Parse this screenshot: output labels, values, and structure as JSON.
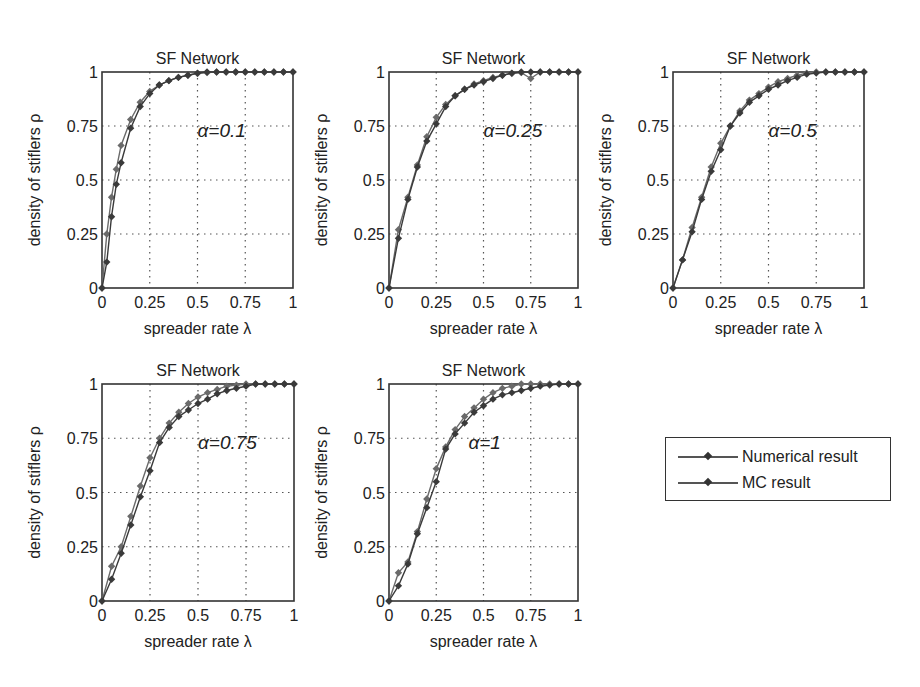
{
  "figure": {
    "panel_title": "SF Network",
    "xlabel": "spreader rate λ",
    "ylabel": "density of stiflers ρ",
    "xticks": [
      "0",
      "0.25",
      "0.5",
      "0.75",
      "1"
    ],
    "yticks": [
      "0",
      "0.25",
      "0.5",
      "0.75",
      "1"
    ]
  },
  "legend": {
    "items": [
      {
        "label": "Numerical result",
        "color": "#555555"
      },
      {
        "label": "MC result",
        "color": "#333333"
      }
    ]
  },
  "chart_data": [
    {
      "type": "line",
      "title": "SF Network",
      "annotation": "α=0.1",
      "xlabel": "spreader rate λ",
      "ylabel": "density of stiflers ρ",
      "xlim": [
        0,
        1
      ],
      "ylim": [
        0,
        1
      ],
      "grid": true,
      "x": [
        0,
        0.025,
        0.05,
        0.075,
        0.1,
        0.15,
        0.2,
        0.25,
        0.3,
        0.35,
        0.4,
        0.45,
        0.5,
        0.55,
        0.6,
        0.65,
        0.7,
        0.75,
        0.8,
        0.85,
        0.9,
        0.95,
        1.0
      ],
      "series": [
        {
          "name": "Numerical result",
          "values": [
            0,
            0.25,
            0.42,
            0.55,
            0.66,
            0.78,
            0.86,
            0.91,
            0.94,
            0.96,
            0.975,
            0.985,
            0.993,
            0.997,
            1,
            1,
            1,
            1,
            1,
            1,
            1,
            1,
            1
          ]
        },
        {
          "name": "MC result",
          "values": [
            0,
            0.12,
            0.33,
            0.48,
            0.58,
            0.74,
            0.84,
            0.9,
            0.94,
            0.96,
            0.975,
            0.985,
            0.995,
            1,
            1,
            1,
            1,
            1,
            1,
            1,
            1,
            1,
            1
          ]
        }
      ]
    },
    {
      "type": "line",
      "title": "SF Network",
      "annotation": "α=0.25",
      "xlabel": "spreader rate λ",
      "ylabel": "density of stiflers ρ",
      "xlim": [
        0,
        1
      ],
      "ylim": [
        0,
        1
      ],
      "grid": true,
      "x": [
        0,
        0.05,
        0.1,
        0.15,
        0.2,
        0.25,
        0.3,
        0.35,
        0.4,
        0.45,
        0.5,
        0.55,
        0.6,
        0.65,
        0.7,
        0.75,
        0.8,
        0.85,
        0.9,
        0.95,
        1.0
      ],
      "series": [
        {
          "name": "Numerical result",
          "values": [
            0,
            0.27,
            0.42,
            0.57,
            0.7,
            0.79,
            0.85,
            0.89,
            0.92,
            0.945,
            0.96,
            0.975,
            0.985,
            0.993,
            0.997,
            0.97,
            1,
            1,
            1,
            1,
            1
          ]
        },
        {
          "name": "MC result",
          "values": [
            0,
            0.23,
            0.41,
            0.56,
            0.68,
            0.76,
            0.84,
            0.89,
            0.92,
            0.94,
            0.955,
            0.97,
            0.985,
            0.995,
            1,
            1,
            1,
            1,
            1,
            1,
            1
          ]
        }
      ]
    },
    {
      "type": "line",
      "title": "SF Network",
      "annotation": "α=0.5",
      "xlabel": "spreader rate λ",
      "ylabel": "density of stiflers ρ",
      "xlim": [
        0,
        1
      ],
      "ylim": [
        0,
        1
      ],
      "grid": true,
      "x": [
        0,
        0.05,
        0.1,
        0.15,
        0.2,
        0.25,
        0.3,
        0.35,
        0.4,
        0.45,
        0.5,
        0.55,
        0.6,
        0.65,
        0.7,
        0.75,
        0.8,
        0.85,
        0.9,
        0.95,
        1.0
      ],
      "series": [
        {
          "name": "Numerical result",
          "values": [
            0,
            0.13,
            0.28,
            0.42,
            0.56,
            0.67,
            0.75,
            0.82,
            0.87,
            0.9,
            0.93,
            0.955,
            0.97,
            0.985,
            0.995,
            1,
            1,
            1,
            1,
            1,
            1
          ]
        },
        {
          "name": "MC result",
          "values": [
            0,
            0.13,
            0.26,
            0.41,
            0.54,
            0.64,
            0.75,
            0.81,
            0.86,
            0.89,
            0.92,
            0.94,
            0.96,
            0.975,
            0.99,
            0.995,
            1,
            1,
            1,
            1,
            1
          ]
        }
      ]
    },
    {
      "type": "line",
      "title": "SF Network",
      "annotation": "α=0.75",
      "xlabel": "spreader rate λ",
      "ylabel": "density of stiflers ρ",
      "xlim": [
        0,
        1
      ],
      "ylim": [
        0,
        1
      ],
      "grid": true,
      "x": [
        0,
        0.05,
        0.1,
        0.15,
        0.2,
        0.25,
        0.3,
        0.35,
        0.4,
        0.45,
        0.5,
        0.55,
        0.6,
        0.65,
        0.7,
        0.75,
        0.8,
        0.85,
        0.9,
        0.95,
        1.0
      ],
      "series": [
        {
          "name": "Numerical result",
          "values": [
            0,
            0.16,
            0.25,
            0.39,
            0.53,
            0.66,
            0.75,
            0.82,
            0.87,
            0.91,
            0.94,
            0.96,
            0.975,
            0.99,
            0.995,
            1,
            1,
            1,
            1,
            1,
            1
          ]
        },
        {
          "name": "MC result",
          "values": [
            0,
            0.1,
            0.22,
            0.35,
            0.48,
            0.6,
            0.73,
            0.8,
            0.85,
            0.88,
            0.91,
            0.93,
            0.955,
            0.97,
            0.98,
            0.99,
            1,
            1,
            1,
            1,
            1
          ]
        }
      ]
    },
    {
      "type": "line",
      "title": "SF Network",
      "annotation": "α=1",
      "xlabel": "spreader rate λ",
      "ylabel": "density of stiflers ρ",
      "xlim": [
        0,
        1
      ],
      "ylim": [
        0,
        1
      ],
      "grid": true,
      "x": [
        0,
        0.05,
        0.1,
        0.15,
        0.2,
        0.25,
        0.3,
        0.35,
        0.4,
        0.45,
        0.5,
        0.55,
        0.6,
        0.65,
        0.7,
        0.75,
        0.8,
        0.85,
        0.9,
        0.95,
        1.0
      ],
      "series": [
        {
          "name": "Numerical result",
          "values": [
            0,
            0.13,
            0.18,
            0.32,
            0.47,
            0.61,
            0.71,
            0.79,
            0.85,
            0.89,
            0.93,
            0.96,
            0.98,
            0.99,
            1,
            1,
            1,
            1,
            1,
            1,
            1
          ]
        },
        {
          "name": "MC result",
          "values": [
            0,
            0.07,
            0.17,
            0.31,
            0.43,
            0.55,
            0.7,
            0.77,
            0.82,
            0.87,
            0.9,
            0.93,
            0.95,
            0.96,
            0.97,
            0.98,
            0.99,
            0.995,
            1,
            1,
            1
          ]
        }
      ]
    }
  ]
}
